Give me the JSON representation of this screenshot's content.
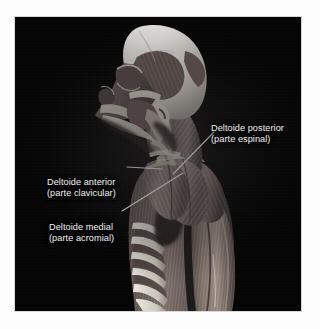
{
  "figure": {
    "kind": "anatomical-illustration",
    "view": "lateral-oblique",
    "background_color": "#050505",
    "page_color": "#fdfdfd",
    "label_text_color": "#f2f2f0",
    "leader_line_color": "#f4f4f2",
    "bone_color": "#e8e6e2",
    "muscle_color": "#8d7f7b",
    "muscle_shadow_color": "#3b3432"
  },
  "annotations": [
    {
      "id": "deltoide-posterior",
      "line1": "Deltoide posterior",
      "line2": "(parte espinal)",
      "leader": {
        "from_x": 214,
        "from_y": 130,
        "to_x": 173,
        "to_y": 172
      }
    },
    {
      "id": "deltoide-anterior",
      "line1": "Deltoide anterior",
      "line2": "(parte clavicular)",
      "leader": {
        "from_x": 127,
        "from_y": 165,
        "to_x": 160,
        "to_y": 167
      }
    },
    {
      "id": "deltoide-medial",
      "line1": "Deltoide medial",
      "line2": "(parte acromial)",
      "leader": {
        "from_x": 122,
        "from_y": 209,
        "to_x": 182,
        "to_y": 171
      }
    }
  ],
  "structures": [
    "cranium",
    "temporal-fossa-muscle",
    "orbit",
    "zygomatic-arch",
    "maxilla",
    "mandible",
    "cervical-vertebrae",
    "sternocleidomastoid",
    "trapezius",
    "deltoid-anterior",
    "deltoid-medial",
    "deltoid-posterior",
    "clavicle",
    "scapula",
    "ribs",
    "intercostal-muscles",
    "serratus-anterior",
    "pectoralis",
    "biceps-brachii",
    "triceps-brachii",
    "latissimus-dorsi"
  ]
}
